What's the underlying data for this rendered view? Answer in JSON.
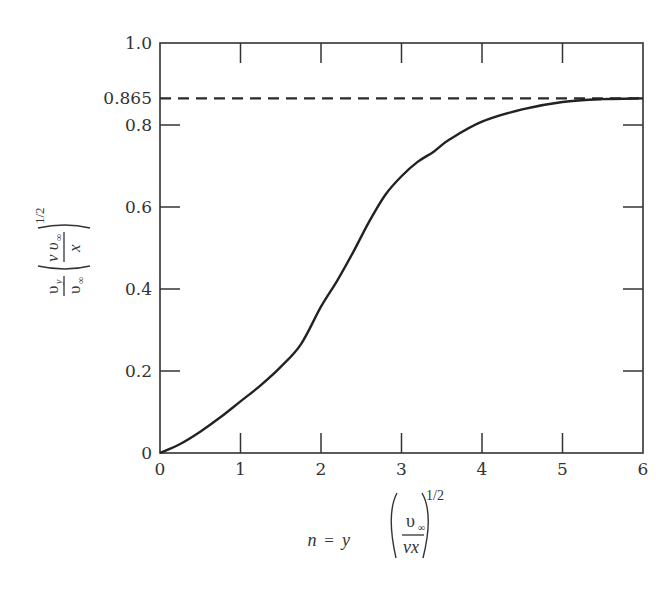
{
  "chart_data": {
    "type": "line",
    "title": "",
    "xlabel": "n = y (υ∞ / νx)^1/2",
    "ylabel": "(υy / υ∞) (ν υ∞ / x)^1/2",
    "xlim": [
      0,
      6
    ],
    "ylim": [
      0,
      1.0
    ],
    "grid": false,
    "legend": null,
    "x_ticks": [
      "0",
      "1",
      "2",
      "3",
      "4",
      "5",
      "6"
    ],
    "y_ticks": [
      "0",
      "0.2",
      "0.4",
      "0.6",
      "0.8",
      "1.0"
    ],
    "series": [
      {
        "name": "velocity profile",
        "style": "solid",
        "x": [
          0,
          0.25,
          0.5,
          0.75,
          1.0,
          1.25,
          1.5,
          1.75,
          2.0,
          2.2,
          2.4,
          2.6,
          2.8,
          3.0,
          3.2,
          3.4,
          3.6,
          4.0,
          4.5,
          5.0,
          5.5,
          6.0
        ],
        "values": [
          0,
          0.022,
          0.052,
          0.087,
          0.126,
          0.165,
          0.21,
          0.265,
          0.357,
          0.42,
          0.49,
          0.565,
          0.63,
          0.675,
          0.71,
          0.735,
          0.765,
          0.808,
          0.838,
          0.856,
          0.863,
          0.865
        ]
      },
      {
        "name": "asymptote",
        "style": "dashed",
        "x": [
          0,
          6
        ],
        "values": [
          0.865,
          0.865
        ]
      }
    ],
    "annotations": [
      {
        "text": "0.865",
        "at_y": 0.865,
        "position": "left-axis"
      }
    ]
  },
  "labels": {
    "x_ticks": [
      "0",
      "1",
      "2",
      "3",
      "4",
      "5",
      "6"
    ],
    "y_ticks": [
      "0",
      "0.2",
      "0.4",
      "0.6",
      "0.8",
      "1.0"
    ],
    "asymptote_value": "0.865",
    "xlabel": {
      "lhs": "n",
      "eq": "=",
      "var": "y",
      "num": "υ",
      "num_sub": "∞",
      "den": "νx",
      "exp": "1/2"
    },
    "ylabel": {
      "frac1_num": "υ",
      "frac1_num_sub": "y",
      "frac1_den": "υ",
      "frac1_den_sub": "∞",
      "frac2_num": "ν υ",
      "frac2_num_sub": "∞",
      "frac2_den": "x",
      "exp": "1/2"
    }
  }
}
